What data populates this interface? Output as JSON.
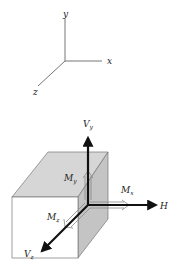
{
  "axes": {
    "x_label": "x",
    "y_label": "y",
    "z_label": "z"
  },
  "cube": {
    "forces": {
      "vy": {
        "main": "V",
        "sub": "y"
      },
      "vz": {
        "main": "V",
        "sub": "z"
      },
      "h": {
        "main": "H"
      }
    },
    "moments": {
      "mx": {
        "main": "M",
        "sub": "x"
      },
      "my": {
        "main": "M",
        "sub": "y"
      },
      "mz": {
        "main": "M",
        "sub": "z"
      }
    }
  },
  "colors": {
    "line": "#555555",
    "arrow": "#111111",
    "top_face": "#d4d4d4",
    "side_face": "#c2c2c2",
    "front_face": "#ffffff"
  }
}
